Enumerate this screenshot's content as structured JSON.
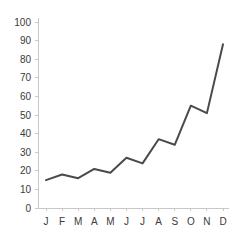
{
  "chart_data": {
    "type": "line",
    "title": "",
    "subtitle": "",
    "xlabel": "",
    "ylabel": "",
    "categories": [
      "J",
      "F",
      "M",
      "A",
      "M",
      "J",
      "J",
      "A",
      "S",
      "O",
      "N",
      "D"
    ],
    "values": [
      15,
      18,
      16,
      21,
      19,
      27,
      24,
      37,
      34,
      55,
      51,
      88
    ],
    "series": [
      {
        "name": "",
        "values": [
          15,
          18,
          16,
          21,
          19,
          27,
          24,
          37,
          34,
          55,
          51,
          88
        ]
      }
    ],
    "ylim": [
      0,
      100
    ],
    "y_ticks": [
      0,
      10,
      20,
      30,
      40,
      50,
      60,
      70,
      80,
      90,
      100
    ],
    "y_tick_labels": [
      "0",
      "10",
      "20",
      "30",
      "40",
      "50",
      "60",
      "70",
      "80",
      "90",
      "100"
    ],
    "x_tick_labels": [
      "J",
      "F",
      "M",
      "A",
      "M",
      "J",
      "J",
      "A",
      "S",
      "O",
      "N",
      "D"
    ],
    "grid": false,
    "legend": false,
    "legend_position": "none",
    "colors": {
      "line": "#4a4a4a",
      "axis": "#c8c8c8",
      "text": "#3a3a3a",
      "background": "#ffffff"
    }
  }
}
